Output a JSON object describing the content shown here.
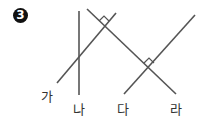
{
  "problem": {
    "number_label": "3",
    "line_labels": {
      "ga": "가",
      "na": "나",
      "da": "다",
      "ra": "라"
    }
  },
  "colors": {
    "line": "#555555",
    "badge": "#111111"
  }
}
